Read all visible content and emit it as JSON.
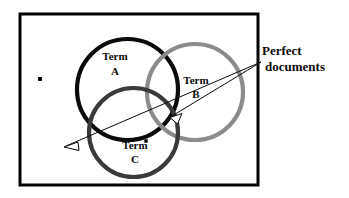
{
  "figure": {
    "type": "venn-diagram",
    "title_visible": false,
    "background_color": "#ffffff",
    "frame": {
      "name": "document-collection-frame",
      "x": 20,
      "y": 14,
      "width": 238,
      "height": 171,
      "stroke_color": "#000000",
      "stroke_width": 3
    },
    "circles": [
      {
        "id": "A",
        "label_line1": "Term",
        "label_line2": "A",
        "cx": 127.5,
        "cy": 89.5,
        "r": 50.5,
        "stroke_color": "#0a0a0a",
        "stroke_width": 4.2,
        "label_x": 115,
        "label_y1": 60,
        "label_y2": 75
      },
      {
        "id": "B",
        "label_line1": "Term",
        "label_line2": "B",
        "cx": 195,
        "cy": 92,
        "r": 48,
        "stroke_color": "#8b8b8b",
        "stroke_width": 4.2,
        "label_x": 196,
        "label_y1": 84,
        "label_y2": 98
      },
      {
        "id": "C",
        "label_line1": "Term",
        "label_line2": "C",
        "cx": 133.5,
        "cy": 132.5,
        "r": 44.5,
        "stroke_color": "#3a3a3a",
        "stroke_width": 4.2,
        "label_x": 135,
        "label_y1": 149,
        "label_y2": 163
      }
    ],
    "callout": {
      "name": "perfect-documents-callout",
      "line1": "Perfect",
      "line2": "documents",
      "text_x": 262,
      "text_y1": 55,
      "text_y2": 71,
      "anchor_x": 261,
      "anchor_y": 62,
      "color": "#0a0a0a"
    },
    "arrows": [
      {
        "name": "arrow-to-triple-intersection",
        "from_x": 261,
        "from_y": 62,
        "to_x": 172,
        "to_y": 116,
        "stroke_color": "#0a0a0a",
        "stroke_width": 1
      },
      {
        "name": "arrow-to-outside-region",
        "from_x": 261,
        "from_y": 62,
        "to_x": 66,
        "to_y": 146,
        "stroke_color": "#0a0a0a",
        "stroke_width": 1
      }
    ],
    "dots": [
      {
        "name": "document-dot-outside",
        "x": 40,
        "y": 79,
        "size": 4,
        "color": "#0a0a0a"
      },
      {
        "name": "document-dot-term-c",
        "x": 146,
        "y": 141,
        "size": 3.5,
        "color": "#0a0a0a"
      }
    ]
  }
}
